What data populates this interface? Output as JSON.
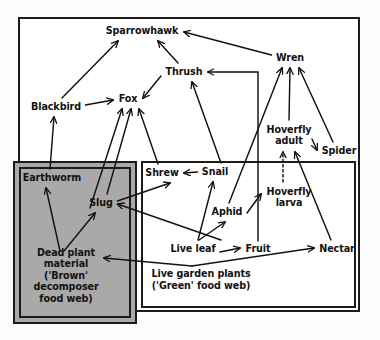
{
  "diagram": {
    "colors": {
      "ink": "#121212",
      "frame": "#1b1b1b",
      "brown_box_fill": "#a9a9a9",
      "page_bg": "#ffffff"
    },
    "nodes": [
      {
        "id": "sparrowhawk",
        "label": "Sparrowhawk",
        "x": 142,
        "y": 31,
        "group": "green"
      },
      {
        "id": "wren",
        "label": "Wren",
        "x": 290,
        "y": 58,
        "group": "green"
      },
      {
        "id": "thrush",
        "label": "Thrush",
        "x": 184,
        "y": 72,
        "group": "green"
      },
      {
        "id": "blackbird",
        "label": "Blackbird",
        "x": 56,
        "y": 107,
        "group": "green"
      },
      {
        "id": "fox",
        "label": "Fox",
        "x": 128,
        "y": 99,
        "group": "green"
      },
      {
        "id": "hoverfly_adult",
        "label": "Hoverfly\nadult",
        "x": 289,
        "y": 135,
        "group": "green"
      },
      {
        "id": "spider",
        "label": "Spider",
        "x": 339,
        "y": 151,
        "group": "green"
      },
      {
        "id": "shrew",
        "label": "Shrew",
        "x": 162,
        "y": 173,
        "group": "green"
      },
      {
        "id": "snail",
        "label": "Snail",
        "x": 215,
        "y": 172,
        "group": "green"
      },
      {
        "id": "earthworm",
        "label": "Earthworm",
        "x": 52,
        "y": 178,
        "group": "brown"
      },
      {
        "id": "slug",
        "label": "Slug",
        "x": 101,
        "y": 203,
        "group": "brown"
      },
      {
        "id": "hoverfly_larva",
        "label": "Hoverfly\nlarva",
        "x": 289,
        "y": 197,
        "group": "green"
      },
      {
        "id": "aphid",
        "label": "Aphid",
        "x": 227,
        "y": 212,
        "group": "green"
      },
      {
        "id": "live_leaf",
        "label": "Live leaf",
        "x": 193,
        "y": 249,
        "group": "green"
      },
      {
        "id": "fruit",
        "label": "Fruit",
        "x": 258,
        "y": 249,
        "group": "green"
      },
      {
        "id": "nectar",
        "label": "Nectar",
        "x": 337,
        "y": 249,
        "group": "green"
      },
      {
        "id": "dead_plant",
        "label": "Dead plant\nmaterial\n('Brown'\ndecomposer\nfood web)",
        "x": 66,
        "y": 276,
        "group": "brown"
      }
    ],
    "group_labels": [
      {
        "id": "green_web_label",
        "line1": "Live garden plants",
        "line2": "('Green' food web)",
        "x": 201,
        "y": 268
      }
    ],
    "edges": [
      {
        "from": "blackbird",
        "to": "sparrowhawk",
        "style": "solid"
      },
      {
        "from": "thrush",
        "to": "sparrowhawk",
        "style": "solid"
      },
      {
        "from": "wren",
        "to": "sparrowhawk",
        "style": "solid"
      },
      {
        "from": "snail",
        "to": "thrush",
        "style": "solid"
      },
      {
        "from": "fruit",
        "to": "thrush",
        "style": "solid"
      },
      {
        "from": "thrush",
        "to": "fox",
        "style": "solid"
      },
      {
        "from": "blackbird",
        "to": "fox",
        "style": "solid"
      },
      {
        "from": "earthworm",
        "to": "fox",
        "style": "solid"
      },
      {
        "from": "slug",
        "to": "fox",
        "style": "solid"
      },
      {
        "from": "shrew",
        "to": "fox",
        "style": "solid"
      },
      {
        "from": "earthworm",
        "to": "blackbird",
        "style": "solid"
      },
      {
        "from": "snail",
        "to": "shrew",
        "style": "solid"
      },
      {
        "from": "slug",
        "to": "shrew",
        "style": "solid"
      },
      {
        "from": "live_leaf",
        "to": "snail",
        "style": "solid"
      },
      {
        "from": "live_leaf",
        "to": "aphid",
        "style": "solid"
      },
      {
        "from": "live_leaf",
        "to": "slug",
        "style": "solid"
      },
      {
        "from": "live_leaf",
        "to": "dead_plant",
        "style": "solid"
      },
      {
        "from": "live_leaf",
        "to": "fruit",
        "style": "solid"
      },
      {
        "from": "dead_plant",
        "to": "earthworm",
        "style": "solid"
      },
      {
        "from": "dead_plant",
        "to": "slug",
        "style": "solid"
      },
      {
        "from": "aphid",
        "to": "hoverfly_larva",
        "style": "solid"
      },
      {
        "from": "aphid",
        "to": "wren",
        "style": "solid"
      },
      {
        "from": "hoverfly_larva",
        "to": "hoverfly_adult",
        "style": "dashed"
      },
      {
        "from": "nectar",
        "to": "hoverfly_adult",
        "style": "solid"
      },
      {
        "from": "hoverfly_adult",
        "to": "spider",
        "style": "solid"
      },
      {
        "from": "hoverfly_adult",
        "to": "wren",
        "style": "solid"
      },
      {
        "from": "spider",
        "to": "wren",
        "style": "solid"
      },
      {
        "from": "live_leaf",
        "to": "nectar",
        "style": "solid"
      }
    ]
  }
}
